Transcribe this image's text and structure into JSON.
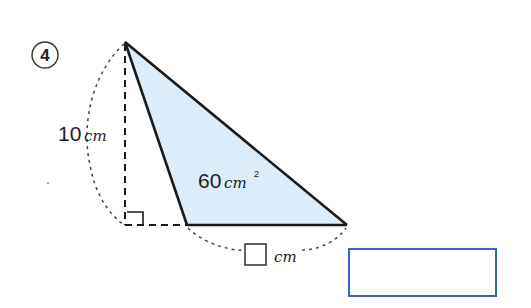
{
  "problem": {
    "number_label": "4",
    "height_label": {
      "value": "10",
      "unit": "cm"
    },
    "area_label": {
      "value": "60",
      "unit": "cm",
      "superscript": "2"
    },
    "base_label": {
      "unit": "cm"
    }
  },
  "colors": {
    "triangle_fill": "#dcecf8",
    "stroke": "#1a1a1a",
    "answer_border": "#3a64c4"
  },
  "answer_box": {
    "value": ""
  }
}
